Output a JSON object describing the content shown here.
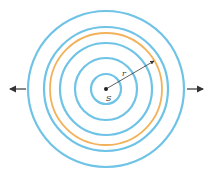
{
  "diagram": {
    "source_label": "S",
    "radius_label": "r",
    "center": [
      106,
      89
    ],
    "wavefront_radii": [
      15,
      31,
      46,
      62,
      78
    ],
    "highlighted_radius": 57,
    "colors": {
      "wavefront": "#6ec3e6",
      "highlight": "#f2b25a",
      "arrow": "#333333",
      "source": "#222222"
    }
  }
}
